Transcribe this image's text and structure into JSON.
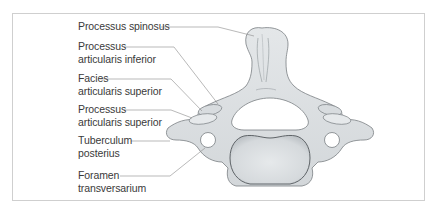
{
  "figure": {
    "labels": [
      {
        "id": "processus-spinosus",
        "lines": [
          "Processus spinosus"
        ]
      },
      {
        "id": "processus-articularis-inferior",
        "lines": [
          "Processus",
          "articularis inferior"
        ]
      },
      {
        "id": "facies-articularis-superior",
        "lines": [
          "Facies",
          "articularis superior"
        ]
      },
      {
        "id": "processus-articularis-superior",
        "lines": [
          "Processus",
          "articularis superior"
        ]
      },
      {
        "id": "tuberculum-posterius",
        "lines": [
          "Tuberculum",
          "posterius"
        ]
      },
      {
        "id": "foramen-transversarium",
        "lines": [
          "Foramen",
          "transversarium"
        ]
      }
    ]
  },
  "colors": {
    "bone_fill": "#dfe3e5",
    "bone_shade": "#c7ccd0",
    "outline": "#6f7478",
    "leader": "#8a8a8a",
    "text": "#3a3a3a",
    "frame": "#cfcfcf"
  }
}
